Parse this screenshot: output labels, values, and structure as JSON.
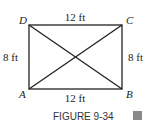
{
  "figure": {
    "caption": "FIGURE 9-34",
    "vertices": {
      "A": "A",
      "B": "B",
      "C": "C",
      "D": "D"
    },
    "labels": {
      "top": "12 ft",
      "bottom": "12 ft",
      "left": "8 ft",
      "right": "8 ft"
    },
    "marker_color": "#8a8a8a"
  }
}
